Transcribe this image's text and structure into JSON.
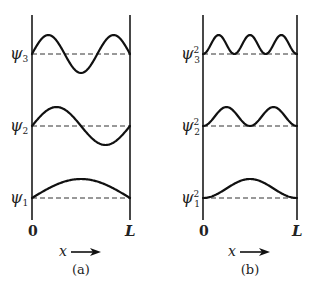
{
  "figure": {
    "panels": [
      {
        "id": "a",
        "caption": "(a)",
        "axis_left_label": "0",
        "axis_right_label": "L",
        "x_axis_label": "x",
        "quantity": "wavefunction",
        "curves": [
          {
            "label": "ψ",
            "subscript": "1",
            "superscript": "",
            "n": 1,
            "kind": "psi"
          },
          {
            "label": "ψ",
            "subscript": "2",
            "superscript": "",
            "n": 2,
            "kind": "psi"
          },
          {
            "label": "ψ",
            "subscript": "3",
            "superscript": "",
            "n": 3,
            "kind": "psi"
          }
        ]
      },
      {
        "id": "b",
        "caption": "(b)",
        "axis_left_label": "0",
        "axis_right_label": "L",
        "x_axis_label": "x",
        "quantity": "probability density",
        "curves": [
          {
            "label": "ψ",
            "subscript": "1",
            "superscript": "2",
            "n": 1,
            "kind": "psi2"
          },
          {
            "label": "ψ",
            "subscript": "2",
            "superscript": "2",
            "n": 2,
            "kind": "psi2"
          },
          {
            "label": "ψ",
            "subscript": "3",
            "superscript": "2",
            "n": 3,
            "kind": "psi2"
          }
        ]
      }
    ],
    "colors": {
      "ink": "#111111",
      "background": "#ffffff"
    }
  }
}
